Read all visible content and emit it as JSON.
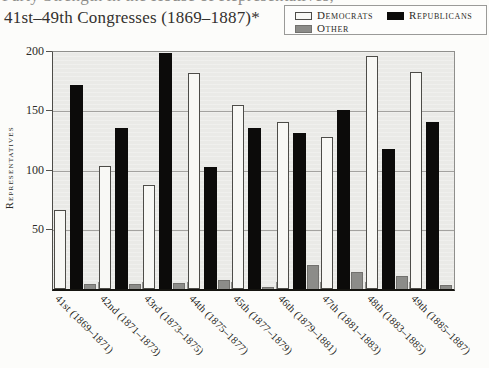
{
  "page": {
    "clipped_title_line": "Party Strength in the House of Representatives,",
    "title": "41st–49th Congresses (1869–1887)*"
  },
  "legend": {
    "items": [
      {
        "label": "Democrats",
        "color": "#f8f8f5",
        "border": "#4d4c48"
      },
      {
        "label": "Republicans",
        "color": "#0c0b0a",
        "border": "#0c0b0a"
      },
      {
        "label": "Other",
        "color": "#8c8c89",
        "border": "#72716e"
      }
    ]
  },
  "chart_data": {
    "type": "bar",
    "title": "41st–49th Congresses (1869–1887)*",
    "xlabel": "",
    "ylabel": "Representatives",
    "ylim": [
      0,
      200
    ],
    "yticks": [
      50,
      100,
      150,
      200
    ],
    "grid": true,
    "legend_position": "top-right",
    "plot_background": "#eaeae7",
    "categories": [
      "41st (1869–1871)",
      "42nd (1871–1873)",
      "43rd (1873–1875)",
      "44th (1875–1877)",
      "45th (1877–1879)",
      "46th (1879–1881)",
      "47th (1881–1883)",
      "48th (1883–1885)",
      "49th (1885–1887)"
    ],
    "series": [
      {
        "name": "Democrats",
        "color": "#f8f8f5",
        "values": [
          67,
          104,
          88,
          182,
          155,
          141,
          128,
          197,
          183
        ]
      },
      {
        "name": "Republicans",
        "color": "#0c0b0a",
        "values": [
          172,
          136,
          199,
          103,
          136,
          132,
          151,
          118,
          141
        ]
      },
      {
        "name": "Other",
        "color": "#8c8c89",
        "values": [
          4,
          4,
          5,
          8,
          2,
          20,
          14,
          11,
          3
        ]
      }
    ]
  }
}
